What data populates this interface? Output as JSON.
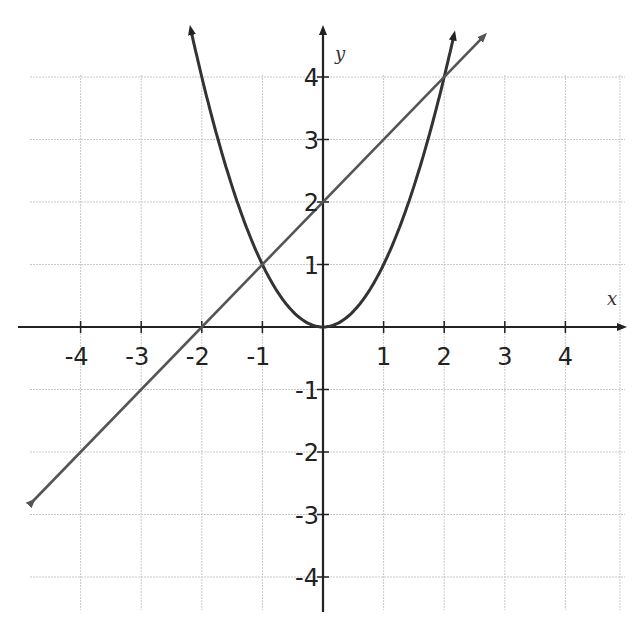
{
  "chart_data": {
    "type": "line",
    "title": "",
    "xlabel": "x",
    "ylabel": "y",
    "xlim": [
      -5,
      5
    ],
    "ylim": [
      -4.5,
      4.8
    ],
    "grid": true,
    "x_ticks": [
      -4,
      -3,
      -2,
      -1,
      1,
      2,
      3,
      4
    ],
    "y_ticks": [
      4,
      3,
      2,
      1,
      -1,
      -2,
      -3,
      -4
    ],
    "series": [
      {
        "name": "parabola",
        "equation": "y = x^2",
        "color": "#333333",
        "x": [
          -2.2,
          -2,
          -1.5,
          -1,
          -0.5,
          0,
          0.5,
          1,
          1.5,
          2,
          2.2
        ],
        "y": [
          4.84,
          4,
          2.25,
          1,
          0.25,
          0,
          0.25,
          1,
          2.25,
          4,
          4.84
        ]
      },
      {
        "name": "line",
        "equation": "y = x + 2",
        "color": "#555555",
        "x": [
          -5,
          -4,
          -3,
          -2,
          -1,
          0,
          1,
          2,
          2.65
        ],
        "y": [
          -3,
          -2,
          -1,
          0,
          1,
          2,
          3,
          4,
          4.65
        ]
      }
    ],
    "intersections": [
      {
        "x": -1,
        "y": 1
      },
      {
        "x": 2,
        "y": 4
      }
    ]
  },
  "axes": {
    "x_label": "x",
    "y_label": "y",
    "x_tick_labels": [
      "-4",
      "-3",
      "-2",
      "-1",
      "1",
      "2",
      "3",
      "4"
    ],
    "y_tick_labels": [
      "4",
      "3",
      "2",
      "1",
      "-1",
      "-2",
      "-3",
      "-4"
    ]
  }
}
